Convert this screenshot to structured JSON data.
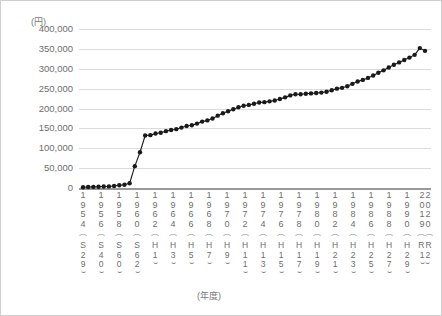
{
  "axes": {
    "y_unit_label": "(円)",
    "x_axis_label": "(年度)",
    "y_ticks": [
      "400,000",
      "350,000",
      "300,000",
      "250,000",
      "200,000",
      "150,000",
      "100,000",
      "50,000",
      "0"
    ]
  },
  "chart_data": {
    "type": "line",
    "title": "",
    "xlabel": "(年度)",
    "ylabel": "(円)",
    "ylim": [
      0,
      400000
    ],
    "grid": true,
    "legend": "none",
    "marker": "filled-circle",
    "line_color": "#1a1a1a",
    "x": [
      1954,
      1955,
      1956,
      1957,
      1958,
      1959,
      1960,
      1961,
      1962,
      1963,
      1964,
      1965,
      1966,
      1967,
      1968,
      1969,
      1970,
      1971,
      1972,
      1973,
      1974,
      1975,
      1976,
      1977,
      1978,
      1979,
      1980,
      1981,
      1982,
      1983,
      1984,
      1985,
      1986,
      1987,
      1988,
      1989,
      1990,
      1991,
      1992,
      1993,
      1994,
      1995,
      1996,
      1997,
      1998,
      1999,
      2000,
      2001,
      2002,
      2003,
      2004,
      2005,
      2006,
      2007,
      2008,
      2009,
      2010,
      2011,
      2012,
      2013,
      2014,
      2015,
      2016,
      2017,
      2018,
      2019,
      2020
    ],
    "values": [
      1800,
      2400,
      2800,
      3200,
      3600,
      4000,
      5200,
      6800,
      8200,
      12000,
      55000,
      90000,
      132000,
      133000,
      137000,
      139000,
      143000,
      146000,
      148000,
      152000,
      156000,
      158000,
      162000,
      167000,
      170000,
      175000,
      182000,
      188000,
      193000,
      198000,
      203000,
      207000,
      209000,
      212000,
      215000,
      216000,
      218000,
      220000,
      224000,
      228000,
      233000,
      236000,
      236000,
      237000,
      238000,
      239000,
      240000,
      242000,
      246000,
      250000,
      252000,
      256000,
      262000,
      268000,
      272000,
      277000,
      283000,
      290000,
      296000,
      303000,
      310000,
      316000,
      322000,
      328000,
      335000,
      352000,
      345000
    ],
    "tick_years": [
      {
        "year": "1954",
        "era_letter": "S",
        "era_year": "29"
      },
      {
        "year": "1956",
        "era_letter": "S",
        "era_year": "40"
      },
      {
        "year": "1958",
        "era_letter": "S",
        "era_year": "60"
      },
      {
        "year": "1960",
        "era_letter": "S",
        "era_year": "62"
      },
      {
        "year": "1962",
        "era_letter": "H",
        "era_year": "1"
      },
      {
        "year": "1964",
        "era_letter": "H",
        "era_year": "3"
      },
      {
        "year": "1966",
        "era_letter": "H",
        "era_year": "5"
      },
      {
        "year": "1968",
        "era_letter": "H",
        "era_year": "7"
      },
      {
        "year": "1970",
        "era_letter": "H",
        "era_year": "9"
      },
      {
        "year": "1972",
        "era_letter": "H",
        "era_year": "11"
      },
      {
        "year": "1974",
        "era_letter": "H",
        "era_year": "13"
      },
      {
        "year": "1976",
        "era_letter": "H",
        "era_year": "15"
      },
      {
        "year": "1978",
        "era_letter": "H",
        "era_year": "17"
      },
      {
        "year": "1980",
        "era_letter": "H",
        "era_year": "19"
      },
      {
        "year": "1982",
        "era_letter": "H",
        "era_year": "21"
      },
      {
        "year": "1984",
        "era_letter": "H",
        "era_year": "23"
      },
      {
        "year": "1986",
        "era_letter": "H",
        "era_year": "25"
      },
      {
        "year": "1988",
        "era_letter": "H",
        "era_year": "27"
      },
      {
        "year": "1990",
        "era_letter": "H",
        "era_year": "29"
      },
      {
        "year": "2019",
        "era_letter": "R",
        "era_year": "1",
        "pair_year": "2020",
        "pair_era_letter": "R",
        "pair_era_year": "2"
      }
    ]
  }
}
